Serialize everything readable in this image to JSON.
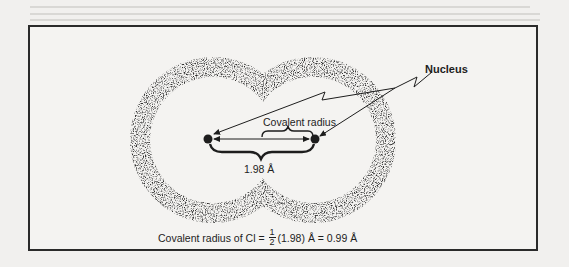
{
  "diagram": {
    "labels": {
      "nucleus": "Nucleus",
      "covalent_radius": "Covalent radius",
      "internuclear_distance": "1.98 Å"
    },
    "formula": {
      "prefix": "Covalent radius of Cl =",
      "fraction_numerator": "1",
      "fraction_denominator": "2",
      "suffix": "(1.98) Å = 0.99 Å"
    },
    "elements": {
      "atoms": [
        "Cl",
        "Cl"
      ],
      "bond_length": "1.98 Å",
      "covalent_radius_value": "0.99 Å"
    },
    "colors": {
      "ink": "#1d1d1d",
      "background": "#f4f3f1",
      "frame": "#2a2a2a"
    }
  }
}
